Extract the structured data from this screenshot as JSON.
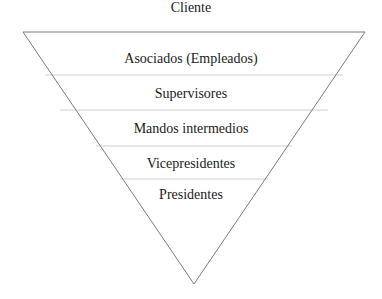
{
  "diagram": {
    "type": "inverted-pyramid",
    "top_label": "Cliente",
    "levels": [
      {
        "label": "Asociados (Empleados)"
      },
      {
        "label": "Supervisores"
      },
      {
        "label": "Mandos intermedios"
      },
      {
        "label": "Vicepresidentes"
      },
      {
        "label": "Presidentes"
      }
    ],
    "colors": {
      "outline": "#7a7a7a",
      "divider": "#d0d0d0",
      "text": "#1a1a1a"
    }
  }
}
